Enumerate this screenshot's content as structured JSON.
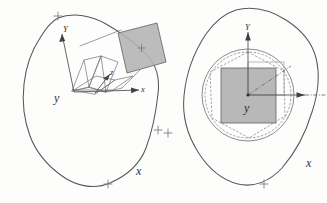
{
  "figure": {
    "background_color": "#fdfdfc",
    "line_color": "#55575a",
    "shade_color": "#b3b3b3",
    "panel_count": 2
  },
  "left_panel": {
    "name": "reference-configuration",
    "blob": {
      "name": "body-outline",
      "style": "rounded-polygon",
      "marker_symbol": "+",
      "markers": [
        {
          "label": "+",
          "x": 58,
          "y": 16
        },
        {
          "label": "+",
          "x": 158,
          "y": 130
        },
        {
          "label": "+",
          "x": 108,
          "y": 184
        }
      ]
    },
    "axes": [
      {
        "name": "axis-Y",
        "label": "Y",
        "style": "italic"
      },
      {
        "name": "axis-x",
        "label": "x",
        "style": "italic"
      },
      {
        "name": "axis-z",
        "label": "z",
        "style": "italic"
      }
    ],
    "labels": {
      "Y": "Y",
      "y": "y",
      "x_local": "x",
      "z": "z",
      "x_global": "x"
    },
    "shaded_element": {
      "name": "shaded-patch",
      "shape": "tilted-rectangle",
      "fill": "#b3b3b3",
      "center_marker": "+"
    },
    "zigzag": {
      "name": "element-mesh-zigzag",
      "description": "folded quadrilateral element strip"
    }
  },
  "right_panel": {
    "name": "deformed-configuration",
    "blob": {
      "name": "body-outline",
      "style": "rounded-polygon",
      "marker_symbol": "+",
      "markers": [
        {
          "label": "+",
          "x": 4,
          "y": 133
        },
        {
          "label": "+",
          "x": 100,
          "y": 184
        },
        {
          "label": "+",
          "x": 152,
          "y": 58
        }
      ]
    },
    "axes": [
      {
        "name": "axis-Y",
        "label": "Y",
        "style": "italic"
      },
      {
        "name": "axis-x",
        "label": "x",
        "style": "italic"
      }
    ],
    "labels": {
      "Y": "Y",
      "y": "y",
      "x_global": "x"
    },
    "circles": [
      {
        "name": "outer-circle-solid",
        "style": "solid"
      },
      {
        "name": "inner-circle-dashed",
        "style": "dashed"
      }
    ],
    "shaded_element": {
      "name": "shaded-square",
      "shape": "square",
      "fill": "#b0b0b0"
    },
    "radial_line": {
      "name": "radius-dashdot",
      "style": "dash-dot"
    }
  }
}
